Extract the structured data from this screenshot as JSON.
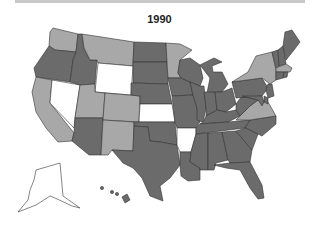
{
  "title": "1990",
  "colors": {
    "dark": "#6b6b6b",
    "light": "#a8a8a8",
    "white": "#ffffff",
    "topbar": "#c8c8c8"
  },
  "map": {
    "categories": [
      "dark",
      "light",
      "white"
    ],
    "states": {
      "WA": "light",
      "OR": "dark",
      "CA": "light",
      "NV": "white",
      "ID": "dark",
      "MT": "light",
      "WY": "white",
      "UT": "light",
      "AZ": "dark",
      "CO": "light",
      "NM": "light",
      "ND": "dark",
      "SD": "dark",
      "NE": "dark",
      "KS": "white",
      "OK": "dark",
      "TX": "dark",
      "MN": "light",
      "IA": "dark",
      "MO": "dark",
      "AR": "white",
      "LA": "dark",
      "WI": "dark",
      "IL": "dark",
      "MI": "dark",
      "IN": "dark",
      "OH": "dark",
      "KY": "dark",
      "TN": "dark",
      "MS": "dark",
      "AL": "dark",
      "GA": "dark",
      "FL": "dark",
      "SC": "dark",
      "NC": "dark",
      "VA": "light",
      "WV": "dark",
      "PA": "dark",
      "NY": "light",
      "VT": "dark",
      "NH": "dark",
      "ME": "dark",
      "MA": "light",
      "CT": "dark",
      "RI": "dark",
      "NJ": "dark",
      "DE": "dark",
      "MD": "dark",
      "AK": "white",
      "HI": "dark"
    }
  }
}
